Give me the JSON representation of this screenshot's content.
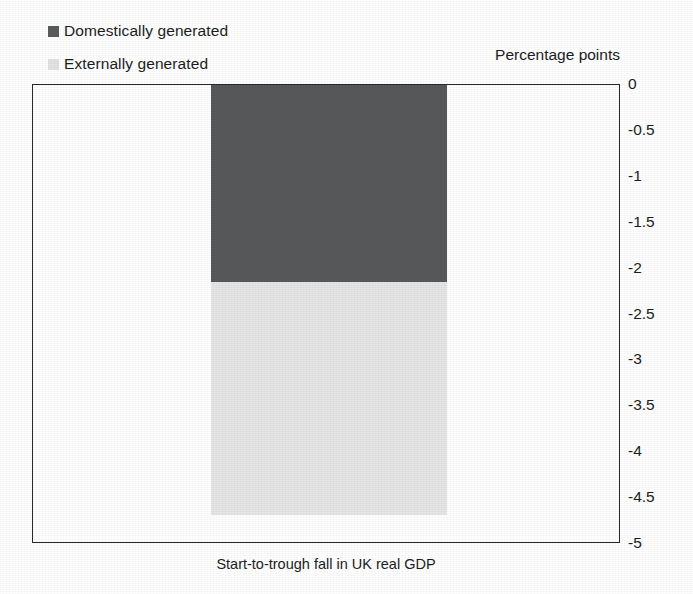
{
  "legend": {
    "items": [
      {
        "label": "Domestically generated",
        "color": "#58595b",
        "swatch": "dark"
      },
      {
        "label": "Externally generated",
        "color": "#e6e6e6",
        "swatch": "light"
      }
    ]
  },
  "axis": {
    "unit_caption": "Percentage points",
    "tick_labels": [
      "0",
      "-0.5",
      "-1",
      "-1.5",
      "-2",
      "-2.5",
      "-3",
      "-3.5",
      "-4",
      "-4.5",
      "-5"
    ]
  },
  "caption": {
    "x_axis": "Start-to-trough fall in UK real GDP"
  },
  "chart_data": {
    "type": "bar",
    "orientation": "vertical",
    "stacked": true,
    "title": "",
    "subtitle": "",
    "xlabel": "Start-to-trough fall in UK real GDP",
    "ylabel": "Percentage points",
    "categories": [
      "Start-to-trough fall in UK real GDP"
    ],
    "series": [
      {
        "name": "Domestically generated",
        "values": [
          -2.15
        ],
        "color": "#58595b"
      },
      {
        "name": "Externally generated",
        "values": [
          -2.53
        ],
        "color": "#e6e6e6"
      }
    ],
    "cumulative_bottoms": [
      -2.15,
      -4.68
    ],
    "total": -4.68,
    "ylim": [
      -5,
      0
    ],
    "ytick_values": [
      0,
      -0.5,
      -1,
      -1.5,
      -2,
      -2.5,
      -3,
      -3.5,
      -4,
      -4.5,
      -5
    ],
    "ytick_labels": [
      "0",
      "-0.5",
      "-1",
      "-1.5",
      "-2",
      "-2.5",
      "-3",
      "-3.5",
      "-4",
      "-4.5",
      "-5"
    ],
    "y_axis_position": "right",
    "grid": false,
    "legend_position": "top-left",
    "legend_entries": [
      "Domestically generated",
      "Externally generated"
    ],
    "annotations": []
  }
}
